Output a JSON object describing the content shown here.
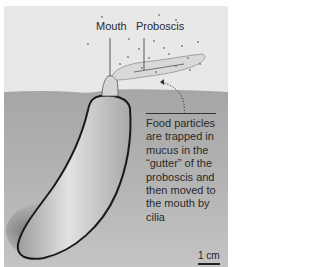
{
  "figure": {
    "labels": {
      "mouth": "Mouth",
      "proboscis": "Proboscis"
    },
    "caption": "Food particles are trapped in mucus in the “gutter” of the proboscis and then moved to the mouth by cilia",
    "scale_bar": {
      "label": "1 cm"
    },
    "colors": {
      "water": "#e8e8e8",
      "sediment": "#a9a9a9",
      "body": "#c8c8c8",
      "outline": "#1a1a1a",
      "text": "#2a2a2a"
    }
  }
}
